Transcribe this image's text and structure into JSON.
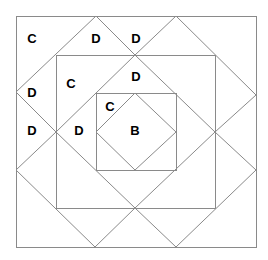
{
  "diagram": {
    "line_color": "#8a8a8a",
    "line_width": 1,
    "background": "#ffffff",
    "squares": [
      {
        "name": "outer-square",
        "x": 16,
        "y": 16,
        "w": 240,
        "h": 231
      },
      {
        "name": "middle-square",
        "x": 56,
        "y": 55,
        "w": 159,
        "h": 153
      },
      {
        "name": "inner-square",
        "x": 96,
        "y": 93,
        "w": 80,
        "h": 77
      }
    ],
    "diamonds": [
      {
        "name": "middle-diamond",
        "points": "135,55 215,132 135,208 56,132"
      },
      {
        "name": "inner-diamond",
        "points": "135,93 176,132 135,170 96,132"
      }
    ],
    "segments": [
      {
        "name": "outer-edge-top-left",
        "x1": 96,
        "y1": 16,
        "x2": 16,
        "y2": 92
      },
      {
        "name": "outer-edge-top-left-in",
        "x1": 96,
        "y1": 16,
        "x2": 135,
        "y2": 55
      },
      {
        "name": "outer-edge-top-right-in",
        "x1": 176,
        "y1": 16,
        "x2": 135,
        "y2": 55
      },
      {
        "name": "outer-edge-top-right",
        "x1": 176,
        "y1": 16,
        "x2": 256,
        "y2": 95
      },
      {
        "name": "outer-edge-left-top-in",
        "x1": 16,
        "y1": 92,
        "x2": 56,
        "y2": 132
      },
      {
        "name": "outer-edge-left-bot-in",
        "x1": 16,
        "y1": 170,
        "x2": 56,
        "y2": 132
      },
      {
        "name": "outer-edge-bottom-left",
        "x1": 16,
        "y1": 170,
        "x2": 95,
        "y2": 247
      },
      {
        "name": "outer-edge-right-top-in",
        "x1": 256,
        "y1": 95,
        "x2": 215,
        "y2": 132
      },
      {
        "name": "outer-edge-right-bot-in",
        "x1": 256,
        "y1": 170,
        "x2": 215,
        "y2": 132
      },
      {
        "name": "outer-edge-bottom-right",
        "x1": 256,
        "y1": 170,
        "x2": 176,
        "y2": 247
      },
      {
        "name": "outer-edge-bot-left-in",
        "x1": 95,
        "y1": 247,
        "x2": 135,
        "y2": 208
      },
      {
        "name": "outer-edge-bot-right-in",
        "x1": 176,
        "y1": 247,
        "x2": 135,
        "y2": 208
      }
    ],
    "labels": [
      {
        "text": "C",
        "x": 32,
        "y": 38
      },
      {
        "text": "D",
        "x": 96,
        "y": 38
      },
      {
        "text": "D",
        "x": 136,
        "y": 38
      },
      {
        "text": "D",
        "x": 136,
        "y": 76
      },
      {
        "text": "C",
        "x": 71,
        "y": 83
      },
      {
        "text": "D",
        "x": 32,
        "y": 92
      },
      {
        "text": "C",
        "x": 110,
        "y": 106
      },
      {
        "text": "D",
        "x": 32,
        "y": 130
      },
      {
        "text": "D",
        "x": 79,
        "y": 130
      },
      {
        "text": "B",
        "x": 135,
        "y": 130
      }
    ]
  }
}
